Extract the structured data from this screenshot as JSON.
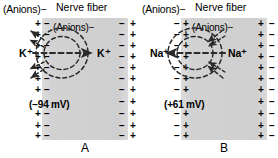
{
  "figure": {
    "colors": {
      "fiber_fill": "#d4d4d4",
      "text": "#000000",
      "arrow": "#2a2a2a"
    }
  },
  "panels": [
    {
      "id": "A",
      "letter": "A",
      "outside_label": "(Anions)−",
      "fiber_label": "Nerve fiber",
      "inside_label": "(Anions)−",
      "potential": "(−94 mV)",
      "ion": "K",
      "ion_charge": "+",
      "ion_label_left": "K⁺",
      "ion_label_right": "K⁺",
      "outer_sign": "+",
      "inner_sign": "−",
      "flow_direction": "outward",
      "arrow_note": "dashed field lines with arrowheads pointing left (out of fiber)",
      "sign_count_per_edge": 11
    },
    {
      "id": "B",
      "letter": "B",
      "outside_label": "(Anions)−",
      "fiber_label": "Nerve fiber",
      "inside_label": "(Anions)−",
      "potential": "(+61 mV)",
      "ion": "Na",
      "ion_charge": "+",
      "ion_label_left": "Na⁺",
      "ion_label_right": "Na⁺",
      "outer_sign": "−",
      "inner_sign": "+",
      "flow_direction": "inward",
      "arrow_note": "dashed field lines with arrowheads pointing left and into fiber",
      "sign_count_per_edge": 11
    }
  ]
}
